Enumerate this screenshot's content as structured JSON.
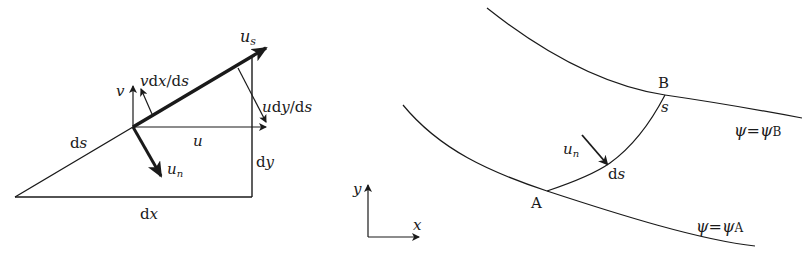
{
  "left_diagram": {
    "title": "velocity components on element ds",
    "labels": {
      "us": "u",
      "us_sub": "s",
      "vdxds": "vdx/ds",
      "v": "v",
      "udyds": "udy/ds",
      "u": "u",
      "ds": "ds",
      "un": "u",
      "un_sub": "n",
      "dy": "dy",
      "dx": "dx"
    }
  },
  "right_diagram": {
    "title": "flow between two streamlines",
    "labels": {
      "B": "B",
      "s": "s",
      "psiB": "ψ=ψ",
      "psiB_sub": "B",
      "un": "u",
      "un_sub": "n",
      "ds": "ds",
      "A": "A",
      "psiA": "ψ=ψ",
      "psiA_sub": "A",
      "axis_y": "y",
      "axis_x": "x"
    }
  },
  "colors": {
    "ink": "#1a1a1a",
    "background": "#ffffff"
  }
}
